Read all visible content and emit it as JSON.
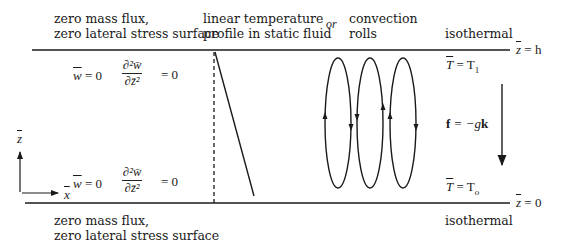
{
  "header": {
    "top_left_label": [
      "zero mass flux,",
      "zero lateral stress surface"
    ],
    "temp_label": [
      "linear temperature",
      "profile in static fluid"
    ],
    "or_label": "or",
    "convection_label": [
      "convection",
      "rolls"
    ],
    "top_right_label": "isothermal"
  },
  "boundaries": {
    "top": {
      "z_label": "z̄ = h",
      "z_var": "z",
      "z_value": "= h",
      "w_condition": "w̄ = 0",
      "w_var": "w",
      "w_rest": " = 0",
      "d2w_num": "∂²w̄",
      "d2w_den": "∂z̄²",
      "d2w_rest": "= 0",
      "temp_condition_var": "T",
      "temp_condition_rest": " = T",
      "temp_sub": "1"
    },
    "bottom": {
      "z_label": "z̄ = 0",
      "z_var": "z",
      "z_value": "= 0",
      "w_condition": "w̄ = 0",
      "w_var": "w",
      "w_rest": " = 0",
      "d2w_num": "∂²w̄",
      "d2w_den": "∂z̄²",
      "d2w_rest": "= 0",
      "temp_condition_var": "T",
      "temp_condition_rest": " = T",
      "temp_sub": "o"
    }
  },
  "bottom_labels": {
    "left": [
      "zero mass flux,",
      "zero lateral stress surface"
    ],
    "right": "isothermal"
  },
  "axes": {
    "x_label": "x",
    "z_label": "z"
  },
  "force": {
    "f": "f",
    "eq": " = −g",
    "k": "k"
  },
  "rolls": {
    "count": 3
  },
  "colors": {
    "ink": "#1a1a1a",
    "background": "#ffffff"
  }
}
